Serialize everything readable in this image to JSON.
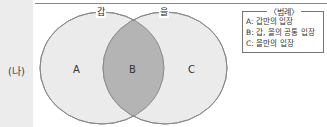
{
  "panel_label": "(나)",
  "sets": [
    {
      "name": "갑",
      "region_label": "A"
    },
    {
      "name": "을",
      "region_label": "C"
    }
  ],
  "intersection_label": "B",
  "legend": {
    "title": "〈범례〉",
    "items": [
      "A: 갑만의 입장",
      "B: 갑, 을의 공통 입장",
      "C: 을만의 입장"
    ]
  },
  "colors": {
    "circle_fill": "#ebebeb",
    "overlap_fill": "#b4b4b4",
    "stroke": "#8a8a8a"
  }
}
